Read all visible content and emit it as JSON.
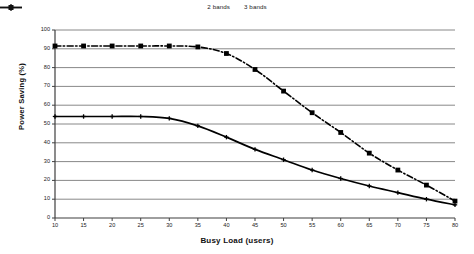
{
  "chart_data": {
    "type": "line",
    "title": "",
    "xlabel": "Busy Load (users)",
    "ylabel": "Power Saving (%)",
    "xlim": [
      10,
      80
    ],
    "ylim": [
      0,
      100
    ],
    "xticks": [
      10,
      15,
      20,
      25,
      30,
      35,
      40,
      45,
      50,
      55,
      60,
      65,
      70,
      75,
      80
    ],
    "yticks": [
      0,
      10,
      20,
      30,
      40,
      50,
      60,
      70,
      80,
      90,
      100
    ],
    "grid": "horizontal",
    "legend_position": "top-center",
    "x": [
      10,
      15,
      20,
      25,
      30,
      35,
      40,
      45,
      50,
      55,
      60,
      65,
      70,
      75,
      80
    ],
    "series": [
      {
        "name": "2 bands",
        "line_style": "solid",
        "marker": "plus",
        "color": "#000000",
        "values": [
          54,
          54,
          54,
          54,
          53,
          49,
          43,
          36.5,
          31,
          25.5,
          21,
          17,
          13.5,
          10,
          7
        ]
      },
      {
        "name": "3 bands",
        "line_style": "dash-dot",
        "marker": "square",
        "color": "#000000",
        "values": [
          91.5,
          91.5,
          91.5,
          91.5,
          91.5,
          91,
          87.5,
          79,
          67.5,
          56,
          45.5,
          34.5,
          25.5,
          17.5,
          9
        ]
      }
    ]
  },
  "legend": {
    "entries": [
      {
        "label": "2 bands"
      },
      {
        "label": "3 bands"
      }
    ]
  },
  "axes": {
    "x_title": "Busy Load (users)",
    "y_title": "Power Saving (%)"
  },
  "style": {
    "axis_color": "#3f3f3f",
    "grid_color": "#7a7a7a",
    "series_color": "#111111",
    "background": "#ffffff"
  }
}
